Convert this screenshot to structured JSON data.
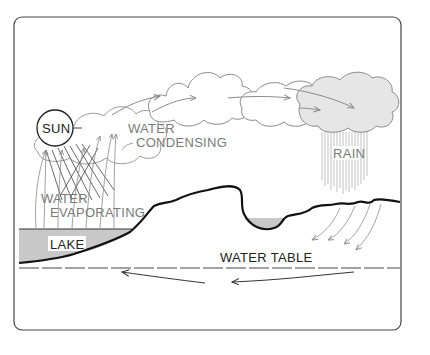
{
  "diagram": {
    "labels": {
      "sun": "SUN",
      "water_condensing_line1": "WATER",
      "water_condensing_line2": "CONDENSING",
      "rain": "RAIN",
      "water_evaporating_line1": "WATER",
      "water_evaporating_line2": "EVAPORATING",
      "lake": "LAKE",
      "water_table": "WATER TABLE"
    },
    "colors": {
      "frame": "#333333",
      "ground_line": "#111111",
      "lake_fill": "#c8c8c8",
      "cloud_stroke": "#8a8a8a",
      "rain_cloud_fill": "#e6e6e6",
      "arrow_grey": "#9a9a9a",
      "arrow_dark": "#333333",
      "text_grey": "#7a7a7a",
      "text_dark": "#222222"
    }
  }
}
